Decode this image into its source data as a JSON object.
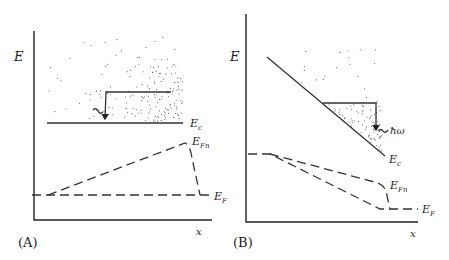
{
  "figure": {
    "panels": [
      {
        "id": "A",
        "panel_label": "(A)",
        "y_axis_label": "E",
        "x_axis_label": "x",
        "band_edge_label": "Ec",
        "band_edge_label_main": "E",
        "band_edge_label_sub": "c",
        "quasi_fermi_label_main": "E",
        "quasi_fermi_label_sub": "Fn",
        "fermi_label_main": "E",
        "fermi_label_sub": "F",
        "description": "Flat conduction band with stippled hot-electron distribution; quasi-Fermi level rises linearly then drops back to EF"
      },
      {
        "id": "B",
        "panel_label": "(B)",
        "y_axis_label": "E",
        "x_axis_label": "x",
        "band_edge_label_main": "E",
        "band_edge_label_sub": "c",
        "photon_label": "ħω",
        "quasi_fermi_label_main": "E",
        "quasi_fermi_label_sub": "Fn",
        "fermi_label_main": "E",
        "fermi_label_sub": "F",
        "description": "Sloped conduction band with photon emission; quasi-Fermi and Fermi levels decrease along x"
      }
    ],
    "colors": {
      "ink": "#222222",
      "background": "#ffffff",
      "stipple": "#555555"
    }
  }
}
